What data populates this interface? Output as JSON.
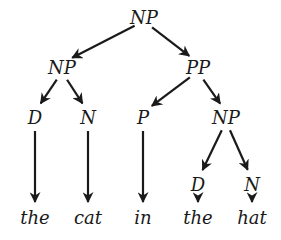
{
  "diagram": {
    "type": "syntax-tree",
    "nodes": [
      {
        "id": "n0",
        "label": "NP",
        "x": 144,
        "y": 18
      },
      {
        "id": "n1",
        "label": "NP",
        "x": 62,
        "y": 68
      },
      {
        "id": "n2",
        "label": "PP",
        "x": 198,
        "y": 68
      },
      {
        "id": "n3",
        "label": "D",
        "x": 35,
        "y": 118
      },
      {
        "id": "n4",
        "label": "N",
        "x": 88,
        "y": 118
      },
      {
        "id": "n5",
        "label": "P",
        "x": 143,
        "y": 118
      },
      {
        "id": "n6",
        "label": "NP",
        "x": 226,
        "y": 118
      },
      {
        "id": "n7",
        "label": "D",
        "x": 198,
        "y": 185
      },
      {
        "id": "n8",
        "label": "N",
        "x": 252,
        "y": 185
      },
      {
        "id": "w0",
        "label": "the",
        "x": 35,
        "y": 218
      },
      {
        "id": "w1",
        "label": "cat",
        "x": 88,
        "y": 218
      },
      {
        "id": "w2",
        "label": "in",
        "x": 143,
        "y": 218
      },
      {
        "id": "w3",
        "label": "the",
        "x": 198,
        "y": 218
      },
      {
        "id": "w4",
        "label": "hat",
        "x": 252,
        "y": 218
      }
    ],
    "edges": [
      {
        "from": "n0",
        "to": "n1"
      },
      {
        "from": "n0",
        "to": "n2"
      },
      {
        "from": "n1",
        "to": "n3"
      },
      {
        "from": "n1",
        "to": "n4"
      },
      {
        "from": "n2",
        "to": "n5"
      },
      {
        "from": "n2",
        "to": "n6"
      },
      {
        "from": "n3",
        "to": "w0"
      },
      {
        "from": "n4",
        "to": "w1"
      },
      {
        "from": "n5",
        "to": "w2"
      },
      {
        "from": "n6",
        "to": "n7"
      },
      {
        "from": "n6",
        "to": "n8"
      },
      {
        "from": "n7",
        "to": "w3"
      },
      {
        "from": "n8",
        "to": "w4"
      }
    ]
  }
}
